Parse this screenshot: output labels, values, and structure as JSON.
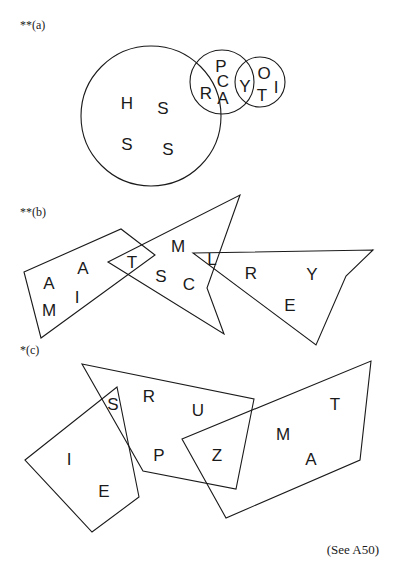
{
  "panels": [
    {
      "id": "a",
      "label": "**(a)",
      "shapes": [
        {
          "type": "circle",
          "name": "large-circle",
          "cx": 151,
          "cy": 116,
          "r": 70
        },
        {
          "type": "circle",
          "name": "middle-circle",
          "cx": 222,
          "cy": 82,
          "r": 32
        },
        {
          "type": "circle",
          "name": "small-circle",
          "cx": 260,
          "cy": 82,
          "r": 25
        }
      ],
      "letters": [
        {
          "char": "H",
          "x": 127,
          "y": 103
        },
        {
          "char": "S",
          "x": 163,
          "y": 108
        },
        {
          "char": "S",
          "x": 127,
          "y": 144
        },
        {
          "char": "S",
          "x": 168,
          "y": 149
        },
        {
          "char": "R",
          "x": 206,
          "y": 93
        },
        {
          "char": "P",
          "x": 221,
          "y": 66
        },
        {
          "char": "C",
          "x": 223,
          "y": 81
        },
        {
          "char": "A",
          "x": 223,
          "y": 98
        },
        {
          "char": "Y",
          "x": 245,
          "y": 86
        },
        {
          "char": "O",
          "x": 264,
          "y": 73
        },
        {
          "char": "T",
          "x": 262,
          "y": 95
        },
        {
          "char": "I",
          "x": 276,
          "y": 87
        }
      ]
    },
    {
      "id": "b",
      "label": "**(b)",
      "shapes": [
        {
          "type": "polygon",
          "name": "left-quadrilateral",
          "points": "24,272 121,229 155,255 41,338"
        },
        {
          "type": "polygon",
          "name": "arrowhead-shape",
          "points": "108,262 240,195 207,288 224,334"
        },
        {
          "type": "polygon",
          "name": "right-quadrilateral",
          "points": "193,253 373,250 346,276 316,345"
        }
      ],
      "letters": [
        {
          "char": "A",
          "x": 49,
          "y": 283
        },
        {
          "char": "A",
          "x": 83,
          "y": 268
        },
        {
          "char": "M",
          "x": 49,
          "y": 310
        },
        {
          "char": "I",
          "x": 77,
          "y": 297
        },
        {
          "char": "T",
          "x": 132,
          "y": 262
        },
        {
          "char": "M",
          "x": 178,
          "y": 246
        },
        {
          "char": "S",
          "x": 161,
          "y": 276
        },
        {
          "char": "C",
          "x": 189,
          "y": 284
        },
        {
          "char": "L",
          "x": 212,
          "y": 259
        },
        {
          "char": "R",
          "x": 251,
          "y": 273
        },
        {
          "char": "Y",
          "x": 312,
          "y": 274
        },
        {
          "char": "E",
          "x": 290,
          "y": 305
        }
      ]
    },
    {
      "id": "c",
      "label": "*(c)",
      "shapes": [
        {
          "type": "polygon",
          "name": "left-quadrilateral",
          "points": "25,460 117,387 139,497 92,532"
        },
        {
          "type": "polygon",
          "name": "middle-quadrilateral",
          "points": "82,364 254,399 236,489 143,471"
        },
        {
          "type": "polygon",
          "name": "right-quadrilateral",
          "points": "182,439 371,361 360,460 226,518"
        }
      ],
      "letters": [
        {
          "char": "S",
          "x": 113,
          "y": 404
        },
        {
          "char": "R",
          "x": 149,
          "y": 396
        },
        {
          "char": "U",
          "x": 198,
          "y": 410
        },
        {
          "char": "P",
          "x": 159,
          "y": 455
        },
        {
          "char": "Z",
          "x": 217,
          "y": 455
        },
        {
          "char": "M",
          "x": 283,
          "y": 434
        },
        {
          "char": "T",
          "x": 335,
          "y": 404
        },
        {
          "char": "A",
          "x": 311,
          "y": 459
        },
        {
          "char": "I",
          "x": 69,
          "y": 459
        },
        {
          "char": "E",
          "x": 104,
          "y": 491
        }
      ]
    }
  ],
  "label_positions": [
    {
      "x": 20,
      "y": 18
    },
    {
      "x": 20,
      "y": 205
    },
    {
      "x": 20,
      "y": 343
    }
  ],
  "footer": {
    "reference": "(See A50)"
  }
}
